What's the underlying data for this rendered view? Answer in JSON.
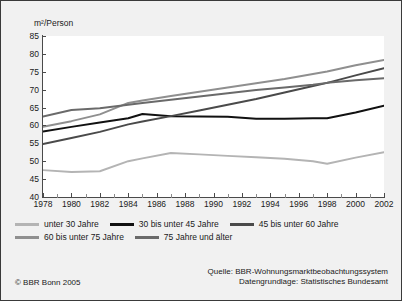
{
  "chart_data": {
    "type": "line",
    "title": "",
    "xlabel": "",
    "ylabel": "m²/Person",
    "ylim": [
      40,
      85
    ],
    "xlim": [
      1978,
      2002
    ],
    "yticks": [
      40,
      45,
      50,
      55,
      60,
      65,
      70,
      75,
      80,
      85
    ],
    "xticks": [
      1978,
      1980,
      1982,
      1984,
      1986,
      1988,
      1990,
      1992,
      1994,
      1996,
      1998,
      2000,
      2002
    ],
    "grid": false,
    "legend_position": "bottom",
    "x": [
      1978,
      1980,
      1982,
      1984,
      1985,
      1987,
      1989,
      1991,
      1993,
      1995,
      1997,
      1998,
      2000,
      2002
    ],
    "series": [
      {
        "name": "unter 30 Jahre",
        "color": "#b4b4b4",
        "width": 1.9,
        "values": [
          47.5,
          47.0,
          47.2,
          50.0,
          50.8,
          52.3,
          51.9,
          51.5,
          51.1,
          50.7,
          50.0,
          49.3,
          51.0,
          52.5
        ]
      },
      {
        "name": "30 bis unter 45 Jahre",
        "color": "#111111",
        "width": 2.0,
        "values": [
          58.3,
          59.6,
          60.8,
          62.0,
          63.2,
          62.6,
          62.5,
          62.4,
          61.9,
          61.9,
          62.0,
          62.0,
          63.6,
          65.5
        ]
      },
      {
        "name": "45 bis unter 60 Jahre",
        "color": "#4a4a4a",
        "width": 2.0,
        "values": [
          54.8,
          56.5,
          58.2,
          60.3,
          61.1,
          62.6,
          64.2,
          65.8,
          67.4,
          69.2,
          71.0,
          71.9,
          74.0,
          76.0
        ]
      },
      {
        "name": "60 bis unter 75 Jahre",
        "color": "#8f8f8f",
        "width": 2.0,
        "values": [
          59.6,
          61.2,
          63.1,
          66.3,
          67.0,
          68.2,
          69.4,
          70.6,
          71.8,
          73.0,
          74.4,
          75.1,
          76.8,
          78.3
        ]
      },
      {
        "name": "75 Jahre und älter",
        "color": "#6a6a6a",
        "width": 2.0,
        "values": [
          62.5,
          64.3,
          64.8,
          65.8,
          66.3,
          67.2,
          68.1,
          69.0,
          69.9,
          70.6,
          71.4,
          71.9,
          72.6,
          73.2
        ]
      }
    ]
  },
  "axis": {
    "y_unit_label": "m²/Person",
    "y_tick_labels": [
      "85",
      "80",
      "75",
      "70",
      "65",
      "60",
      "55",
      "50",
      "45",
      "40"
    ],
    "x_tick_labels": [
      "1978",
      "1980",
      "1982",
      "1984",
      "1986",
      "1988",
      "1990",
      "1992",
      "1994",
      "1996",
      "1998",
      "2000",
      "2002"
    ]
  },
  "legend": {
    "rows": [
      [
        {
          "label": "unter 30 Jahre",
          "color": "#b4b4b4"
        },
        {
          "label": "30 bis unter 45 Jahre",
          "color": "#111111"
        },
        {
          "label": "45 bis unter 60 Jahre",
          "color": "#4a4a4a"
        }
      ],
      [
        {
          "label": "60 bis unter 75 Jahre",
          "color": "#8f8f8f"
        },
        {
          "label": "75 Jahre und älter",
          "color": "#6a6a6a"
        }
      ]
    ]
  },
  "footer": {
    "copyright": "© BBR Bonn 2005",
    "source_line_1": "Quelle: BBR-Wohnungsmarktbeobachtungssystem",
    "source_line_2": "Datengrundlage: Statistisches Bundesamt"
  }
}
